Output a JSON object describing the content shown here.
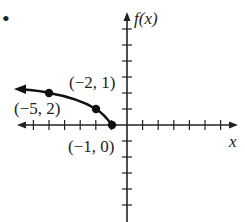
{
  "chart_data": {
    "type": "line",
    "title": "",
    "xlabel": "x",
    "ylabel": "f(x)",
    "bullet": "•",
    "xlim": [
      -7.5,
      7.5
    ],
    "ylim": [
      -6,
      7
    ],
    "grid": false,
    "x_ticks_step": 1,
    "y_ticks_step": 1,
    "series": [
      {
        "name": "f(x)",
        "x": [
          -6.5,
          -5,
          -2,
          -1
        ],
        "y": [
          2.1,
          2,
          1,
          0
        ],
        "left_arrow": true
      }
    ],
    "points": [
      {
        "x": -5,
        "y": 2,
        "label": "(−5, 2)"
      },
      {
        "x": -2,
        "y": 1,
        "label": "(−2, 1)"
      },
      {
        "x": -1,
        "y": 0,
        "label": "(−1, 0)"
      }
    ],
    "colors": {
      "curve": "#111111",
      "axes": "#222222"
    }
  }
}
